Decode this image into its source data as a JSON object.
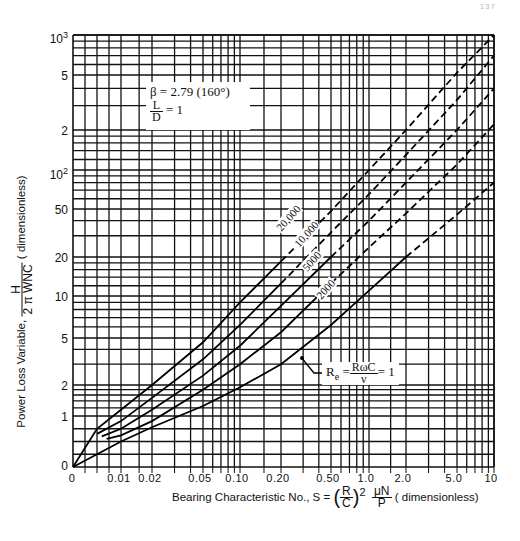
{
  "header": {
    "page_text": "137"
  },
  "chart_data": {
    "type": "line",
    "title": "",
    "xlabel": "Bearing Characteristic No., S = (R/C)^2 μN/P (dimensionless)",
    "ylabel": "Power Loss Variable, H / (2π WNC) (dimensionless)",
    "x_scale": "log (with 0 origin)",
    "y_scale": "log (with 0 origin)",
    "x_ticks": [
      "0",
      "0.01",
      "0.02",
      "0.05",
      "0.10",
      "0.20",
      "0.50",
      "1.0",
      "2.0",
      "5.0",
      "10"
    ],
    "y_ticks": [
      "0",
      "1",
      "2",
      "5",
      "10",
      "20",
      "50",
      "10^2",
      "2",
      "5",
      "10^3"
    ],
    "xlim": [
      0,
      10
    ],
    "ylim": [
      0,
      1000
    ],
    "grid": true,
    "parameters": {
      "beta": "β = 2.79 (160°)",
      "L_over_D": "L/D = 1"
    },
    "series": [
      {
        "name": "Re = 1",
        "style": "solid then dashed",
        "points": [
          [
            0,
            0
          ],
          [
            0.01,
            0.5
          ],
          [
            0.02,
            0.78
          ],
          [
            0.05,
            1.25
          ],
          [
            0.1,
            1.9
          ],
          [
            0.2,
            3.0
          ],
          [
            0.5,
            6.2
          ],
          [
            1.0,
            11
          ],
          [
            2.0,
            20
          ],
          [
            5.0,
            45
          ],
          [
            10,
            80
          ]
        ]
      },
      {
        "name": "Re = 2000",
        "style": "solid then dashed",
        "points": [
          [
            0.007,
            0.55
          ],
          [
            0.01,
            0.62
          ],
          [
            0.02,
            0.9
          ],
          [
            0.05,
            1.8
          ],
          [
            0.1,
            3.0
          ],
          [
            0.2,
            5.5
          ],
          [
            0.5,
            12.5
          ],
          [
            1.0,
            24
          ],
          [
            2.0,
            46
          ],
          [
            5.0,
            110
          ],
          [
            10,
            220
          ]
        ]
      },
      {
        "name": "Re = 5000",
        "style": "solid then dashed",
        "points": [
          [
            0.006,
            0.6
          ],
          [
            0.01,
            0.75
          ],
          [
            0.02,
            1.15
          ],
          [
            0.05,
            2.4
          ],
          [
            0.1,
            4.3
          ],
          [
            0.2,
            8.5
          ],
          [
            0.5,
            20
          ],
          [
            1.0,
            40
          ],
          [
            2.0,
            80
          ],
          [
            5.0,
            200
          ],
          [
            10,
            400
          ]
        ]
      },
      {
        "name": "Re = 10,000",
        "style": "solid then dashed",
        "points": [
          [
            0.005,
            0.65
          ],
          [
            0.01,
            0.9
          ],
          [
            0.02,
            1.5
          ],
          [
            0.05,
            3.3
          ],
          [
            0.1,
            6.2
          ],
          [
            0.2,
            12.5
          ],
          [
            0.5,
            32
          ],
          [
            1.0,
            65
          ],
          [
            2.0,
            130
          ],
          [
            5.0,
            330
          ],
          [
            10,
            700
          ]
        ]
      },
      {
        "name": "Re = 20,000",
        "style": "solid then dashed",
        "points": [
          [
            0,
            0
          ],
          [
            0.005,
            0.75
          ],
          [
            0.01,
            1.15
          ],
          [
            0.02,
            2.0
          ],
          [
            0.05,
            4.6
          ],
          [
            0.1,
            9.0
          ],
          [
            0.2,
            18.5
          ],
          [
            0.5,
            48
          ],
          [
            1.0,
            100
          ],
          [
            2.0,
            200
          ],
          [
            5.0,
            520
          ],
          [
            10,
            1000
          ]
        ]
      }
    ],
    "annotations": [
      "β = 2.79 (160°)",
      "L/D = 1",
      "20,000",
      "10,000",
      "5000",
      "2000",
      "Re = RωC/ν = 1"
    ]
  },
  "labels": {
    "y_ticks": [
      {
        "text": "10",
        "sup": "3",
        "y": 29
      },
      {
        "text": "5",
        "y": 70
      },
      {
        "text": "2",
        "y": 125
      },
      {
        "text": "10",
        "sup": "2",
        "y": 165
      },
      {
        "text": "50",
        "y": 204
      },
      {
        "text": "20",
        "y": 252
      },
      {
        "text": "10",
        "y": 291
      },
      {
        "text": "5",
        "y": 333
      },
      {
        "text": "2",
        "y": 380
      },
      {
        "text": "1",
        "y": 411
      },
      {
        "text": "0",
        "y": 460
      }
    ],
    "x_ticks": [
      {
        "text": "0",
        "x": 72
      },
      {
        "text": "0.01",
        "x": 119
      },
      {
        "text": "0.02",
        "x": 150
      },
      {
        "text": "0.05",
        "x": 200
      },
      {
        "text": "0.10",
        "x": 237
      },
      {
        "text": "0.20",
        "x": 278
      },
      {
        "text": "0.50",
        "x": 328
      },
      {
        "text": "1.0",
        "x": 366
      },
      {
        "text": "2.0",
        "x": 403
      },
      {
        "text": "5.0",
        "x": 454
      },
      {
        "text": "10",
        "x": 491
      }
    ],
    "beta_line": "β = 2.79 (160°)",
    "ld_num": "L",
    "ld_den": "D",
    "ld_value": "= 1",
    "ylabel_prefix": "Power Loss Variable,",
    "ylabel_num": "H",
    "ylabel_den": "2 π WNC",
    "ylabel_suffix": "( dimensionless)",
    "xlabel_prefix": "Bearing Characteristic No., S =",
    "xlabel_r": "R",
    "xlabel_c": "C",
    "xlabel_exp": "2",
    "xlabel_num": "μN",
    "xlabel_den": "P",
    "xlabel_suffix": "( dimensionless)",
    "curve_labels": [
      "20,000",
      "10,000",
      "5000",
      "2000"
    ],
    "re_prefix": "R",
    "re_sub": "e",
    "re_num": "RωC",
    "re_den": "ν",
    "re_value": "= 1"
  }
}
